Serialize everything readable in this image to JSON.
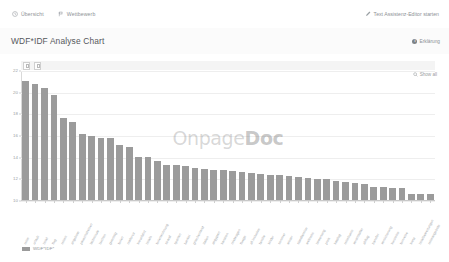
{
  "topbar": {
    "tabs": [
      {
        "label": "Übersicht",
        "icon": "clock-icon"
      },
      {
        "label": "Wettbewerb",
        "icon": "flag-icon"
      }
    ],
    "action": {
      "label": "Text Assistenz-Editor starten",
      "icon": "pencil-icon"
    }
  },
  "title": {
    "text": "WDF*IDF Analyse Chart",
    "help_label": "Erklärung",
    "help_icon": "info-icon"
  },
  "chart_toolbar": {
    "buttons": [
      "panel-toggle-1",
      "panel-toggle-2"
    ],
    "show_all_label": "Show all",
    "show_all_icon": "search-icon"
  },
  "watermark": {
    "prefix": "Onpage",
    "bold": "Doc"
  },
  "legend": [
    {
      "label": "WDF*IDF*",
      "color": "#9b9b9b"
    }
  ],
  "colors": {
    "bar": "#9b9b9b",
    "grid": "#eeeeee",
    "axis": "#c9c9c9",
    "text_muted": "#9a9ea1",
    "title": "#55585b",
    "toolbar_strip": "#f4f4f4"
  },
  "chart_data": {
    "type": "bar",
    "title": "WDF*IDF Analyse Chart",
    "xlabel": "",
    "ylabel": "",
    "ylim": [
      10,
      22
    ],
    "yticks": [
      10,
      12,
      14,
      16,
      18,
      20,
      22
    ],
    "grid": true,
    "legend_position": "bottom-left",
    "series_name": "WDF*IDF*",
    "categories": [
      "reise",
      "urlaub",
      "hotel",
      "flug",
      "reisen",
      "angebote",
      "pauschalreisen",
      "lastminute",
      "buchen",
      "guenstig",
      "ferien",
      "mallorca",
      "kreuzfahrt",
      "hotels",
      "ferienwohnung",
      "strand",
      "spanien",
      "tuerkei",
      "griechenland",
      "italien",
      "aegypten",
      "kanaren",
      "mietwagen",
      "fluege",
      "all inclusive",
      "familie",
      "kinder",
      "sommer",
      "winter",
      "staedtereise",
      "wellness",
      "bewertung",
      "preis",
      "katalog",
      "reisebuero",
      "veranstalter",
      "abflug",
      "transfer",
      "versicherung",
      "kurzreise",
      "fernreise",
      "kreta",
      "hotelbewertungen",
      "reiseangebote"
    ],
    "values": [
      21.0,
      20.7,
      20.3,
      19.7,
      17.6,
      17.2,
      16.1,
      15.9,
      15.7,
      15.7,
      15.1,
      14.9,
      14.0,
      14.0,
      13.6,
      13.2,
      13.2,
      13.1,
      13.0,
      12.9,
      12.8,
      12.8,
      12.7,
      12.6,
      12.5,
      12.4,
      12.3,
      12.3,
      12.2,
      12.1,
      12.0,
      11.9,
      11.9,
      11.8,
      11.7,
      11.6,
      11.5,
      11.2,
      11.2,
      11.1,
      11.1,
      10.6,
      10.6,
      10.6
    ]
  }
}
